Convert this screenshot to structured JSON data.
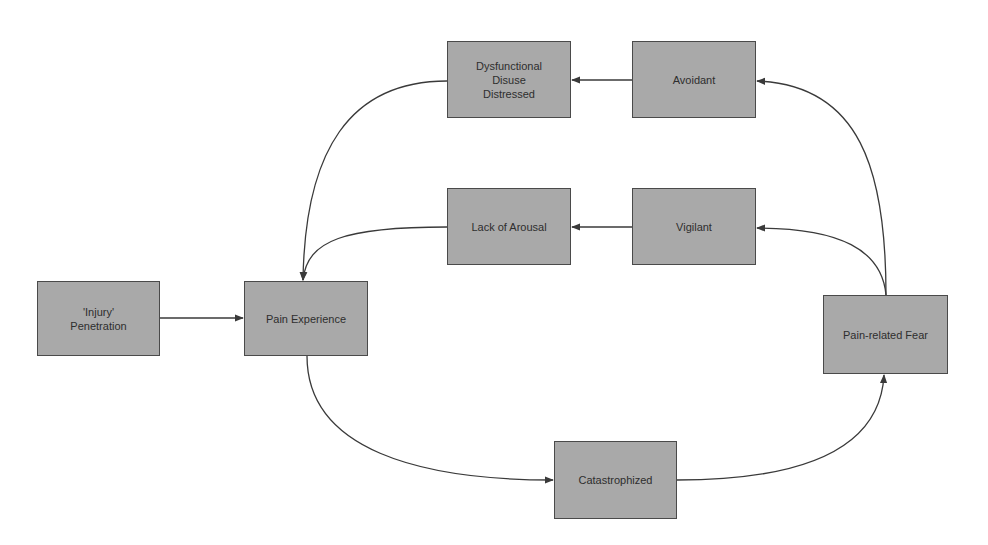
{
  "diagram": {
    "type": "flowchart",
    "colors": {
      "node_fill": "#a9a9a9",
      "node_border": "#4a4a4a",
      "text": "#2e2e2e",
      "edge": "#3a3a3a",
      "background": "#ffffff"
    },
    "nodes": {
      "injury": {
        "line1": "'Injury'",
        "line2": "Penetration"
      },
      "pain_experience": {
        "label": "Pain Experience"
      },
      "dysfunctional": {
        "line1": "Dysfunctional",
        "line2": "Disuse",
        "line3": "Distressed"
      },
      "avoidant": {
        "label": "Avoidant"
      },
      "lack_of_arousal": {
        "label": "Lack of Arousal"
      },
      "vigilant": {
        "label": "Vigilant"
      },
      "pain_related_fear": {
        "label": "Pain-related Fear"
      },
      "catastrophized": {
        "label": "Catastrophized"
      }
    },
    "edges": [
      {
        "from": "'Injury' Penetration",
        "to": "Pain Experience"
      },
      {
        "from": "Pain Experience",
        "to": "Catastrophized"
      },
      {
        "from": "Catastrophized",
        "to": "Pain-related Fear"
      },
      {
        "from": "Pain-related Fear",
        "to": "Vigilant"
      },
      {
        "from": "Pain-related Fear",
        "to": "Avoidant"
      },
      {
        "from": "Vigilant",
        "to": "Lack of Arousal"
      },
      {
        "from": "Avoidant",
        "to": "Dysfunctional Disuse Distressed"
      },
      {
        "from": "Lack of Arousal",
        "to": "Pain Experience"
      },
      {
        "from": "Dysfunctional Disuse Distressed",
        "to": "Pain Experience"
      }
    ]
  }
}
